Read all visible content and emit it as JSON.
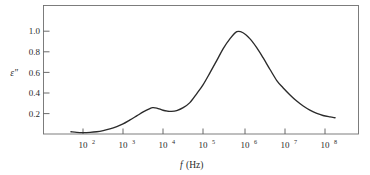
{
  "chart_data": {
    "type": "line",
    "title": "",
    "subtitle": "",
    "xlabel": "f (Hz)",
    "xlabel_symbol": "f",
    "xlabel_unit": "(Hz)",
    "ylabel": "ε″",
    "xscale": "log",
    "yscale": "linear",
    "xlim": [
      10,
      1000000000
    ],
    "ylim": [
      0,
      1.12
    ],
    "grid": false,
    "legend": false,
    "x_ticks": [
      100,
      1000,
      10000,
      100000,
      1000000,
      10000000,
      100000000
    ],
    "x_tick_labels": [
      "10²",
      "10³",
      "10⁴",
      "10⁵",
      "10⁶",
      "10⁷",
      "10⁸"
    ],
    "x_tick_mantissas": [
      "10",
      "10",
      "10",
      "10",
      "10",
      "10",
      "10"
    ],
    "x_tick_exponents": [
      "2",
      "3",
      "4",
      "5",
      "6",
      "7",
      "8"
    ],
    "y_ticks": [
      0.2,
      0.4,
      0.6,
      0.8,
      1.0
    ],
    "y_tick_labels": [
      "0.2",
      "0.4",
      "0.6",
      "0.8",
      "1.0"
    ],
    "series": [
      {
        "name": "dielectric loss",
        "x": [
          50,
          70,
          100,
          150,
          220,
          320,
          470,
          700,
          1000,
          1500,
          2200,
          3200,
          4700,
          5500,
          7000,
          10000,
          13000,
          16000,
          22000,
          32000,
          47000,
          70000,
          100000,
          150000,
          220000,
          320000,
          470000,
          700000,
          1000000,
          1500000,
          2200000,
          3200000,
          4700000,
          7000000,
          10000000,
          15000000,
          22000000,
          32000000,
          47000000,
          70000000,
          100000000,
          150000000,
          200000000
        ],
        "y": [
          0.022,
          0.016,
          0.014,
          0.016,
          0.022,
          0.033,
          0.049,
          0.072,
          0.098,
          0.137,
          0.176,
          0.215,
          0.248,
          0.256,
          0.252,
          0.231,
          0.222,
          0.22,
          0.228,
          0.256,
          0.305,
          0.393,
          0.478,
          0.597,
          0.714,
          0.83,
          0.925,
          0.995,
          0.985,
          0.925,
          0.84,
          0.74,
          0.63,
          0.52,
          0.45,
          0.38,
          0.32,
          0.272,
          0.232,
          0.2,
          0.18,
          0.166,
          0.158
        ]
      }
    ],
    "annotations": {
      "primary_peak": {
        "x": 700000,
        "y": 1.0
      },
      "secondary_peak": {
        "x": 5500,
        "y": 0.256
      },
      "local_minimum": {
        "x": 16000,
        "y": 0.22
      },
      "curve_start": {
        "x": 50,
        "y": 0.022
      },
      "curve_end": {
        "x": 200000000,
        "y": 0.158
      }
    },
    "colors": {
      "curve": "#2b2b2b",
      "frame": "#6f6f6f",
      "text": "#2a2a2a",
      "background": "#ffffff"
    }
  }
}
